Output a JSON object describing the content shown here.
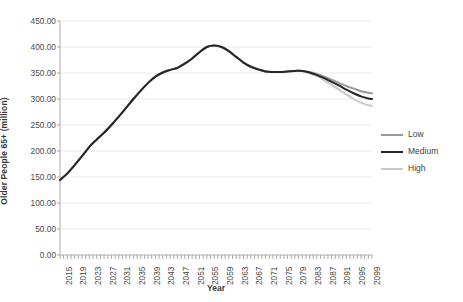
{
  "chart_data": {
    "type": "line",
    "title": "",
    "xlabel": "Year",
    "ylabel": "Older People 65+ (million)",
    "ylim": [
      0,
      450
    ],
    "ytick_labels": [
      "0.00",
      "50.00",
      "100.00",
      "150.00",
      "200.00",
      "250.00",
      "300.00",
      "350.00",
      "400.00",
      "450.00"
    ],
    "ytick_values": [
      0,
      50,
      100,
      150,
      200,
      250,
      300,
      350,
      400,
      450
    ],
    "grid": true,
    "grid_axis": "y",
    "legend_position": "right",
    "xlim": [
      2015,
      2100
    ],
    "xtick_labels": [
      "2015",
      "2019",
      "2023",
      "2027",
      "2031",
      "2035",
      "2039",
      "2043",
      "2047",
      "2051",
      "2055",
      "2059",
      "2063",
      "2067",
      "2071",
      "2075",
      "2079",
      "2083",
      "2087",
      "2091",
      "2095",
      "2099"
    ],
    "xtick_label_rotation": -90,
    "minor_ticks": "annual",
    "x": [
      2015,
      2017,
      2019,
      2021,
      2023,
      2025,
      2027,
      2029,
      2031,
      2033,
      2035,
      2037,
      2039,
      2041,
      2043,
      2045,
      2047,
      2049,
      2051,
      2053,
      2055,
      2057,
      2059,
      2061,
      2063,
      2065,
      2067,
      2069,
      2071,
      2073,
      2075,
      2077,
      2079,
      2081,
      2083,
      2085,
      2087,
      2089,
      2091,
      2093,
      2095,
      2097,
      2099,
      2100
    ],
    "series": [
      {
        "name": "Low",
        "color": "#9b9b9b",
        "width": 2.0,
        "values": [
          144,
          157,
          173,
          190,
          208,
          222,
          235,
          250,
          266,
          283,
          300,
          316,
          331,
          343,
          351,
          356,
          360,
          368,
          378,
          390,
          400,
          403,
          400,
          392,
          381,
          370,
          362,
          357,
          353,
          352,
          352,
          353,
          354,
          354,
          352,
          348,
          343,
          337,
          331,
          325,
          320,
          315,
          312,
          311
        ]
      },
      {
        "name": "Medium",
        "color": "#262626",
        "width": 2.0,
        "values": [
          144,
          157,
          173,
          190,
          208,
          222,
          235,
          250,
          266,
          283,
          300,
          316,
          331,
          343,
          351,
          356,
          360,
          368,
          378,
          390,
          400,
          403,
          400,
          392,
          381,
          370,
          362,
          357,
          353,
          352,
          352,
          353,
          354,
          354,
          351,
          346,
          340,
          333,
          326,
          318,
          311,
          305,
          301,
          300
        ]
      },
      {
        "name": "High",
        "color": "#c8c8c8",
        "width": 2.0,
        "values": [
          144,
          157,
          173,
          190,
          208,
          222,
          235,
          250,
          266,
          283,
          300,
          316,
          331,
          343,
          351,
          356,
          360,
          368,
          378,
          390,
          400,
          403,
          400,
          392,
          381,
          370,
          362,
          357,
          353,
          352,
          352,
          353,
          354,
          354,
          350,
          344,
          336,
          327,
          318,
          309,
          300,
          293,
          288,
          287
        ]
      }
    ]
  },
  "legend": {
    "items": [
      {
        "label": "Low",
        "color": "#9b9b9b",
        "width": "2.0px"
      },
      {
        "label": "Medium",
        "color": "#262626",
        "width": "2.2px"
      },
      {
        "label": "High",
        "color": "#c8c8c8",
        "width": "2.0px"
      }
    ]
  },
  "axes": {
    "x_title": "Year",
    "y_title": "Older People 65+ (million)"
  },
  "colors": {
    "grid": "#eaeaea",
    "axis": "#aaaaaa",
    "text": "#4a4a4a"
  }
}
